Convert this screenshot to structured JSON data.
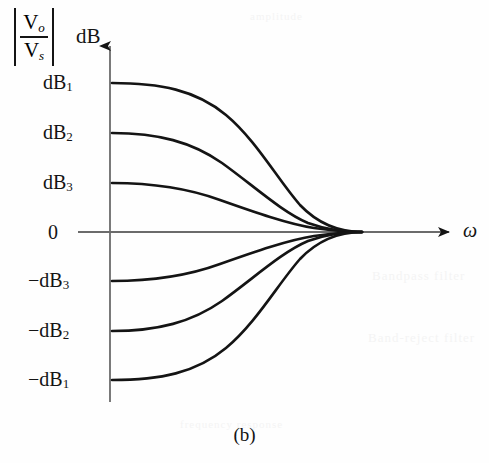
{
  "figure": {
    "caption": "(b)",
    "axis": {
      "y_label_numerator": "V",
      "y_label_numerator_sub": "o",
      "y_label_denominator": "V",
      "y_label_denominator_sub": "s",
      "y_label_unit": "dB",
      "x_label": "ω"
    },
    "y_ticks": [
      {
        "label": "dB",
        "sub": "1",
        "sign": "",
        "value": 83
      },
      {
        "label": "dB",
        "sub": "2",
        "sign": "",
        "value": 133
      },
      {
        "label": "dB",
        "sub": "3",
        "sign": "",
        "value": 183
      },
      {
        "label": "0",
        "sub": "",
        "sign": "",
        "value": 232
      },
      {
        "label": "dB",
        "sub": "3",
        "sign": "−",
        "value": 281
      },
      {
        "label": "dB",
        "sub": "2",
        "sign": "−",
        "value": 331
      },
      {
        "label": "dB",
        "sub": "1",
        "sign": "−",
        "value": 380
      }
    ],
    "bleed_text": {
      "line1": "Bandpass  filter",
      "line2": "Band-reject  filter",
      "line3": "amplitude",
      "line4": "frequency  response"
    },
    "colors": {
      "ink": "#141414",
      "axis": "#6b6b6b",
      "paper": "#fefefe"
    }
  },
  "chart_data": {
    "type": "line",
    "title": "",
    "subtitle": "(b)",
    "xlabel": "ω",
    "ylabel": "|Vo/Vs| dB",
    "grid": false,
    "legend": "none",
    "xlim": [
      110,
      455
    ],
    "ylim": [
      -3,
      3
    ],
    "axis_origin_px": {
      "x": 110,
      "y": 232
    },
    "convergence_point_px": {
      "x": 362,
      "y": 232
    },
    "ytick_labels": [
      "dB₁",
      "dB₂",
      "dB₃",
      "0",
      "−dB₃",
      "−dB₂",
      "−dB₁"
    ],
    "ytick_values": [
      3,
      2,
      1,
      0,
      -1,
      -2,
      -3
    ],
    "series": [
      {
        "name": "dB1 boost",
        "start_level": "dB₁",
        "path": "M 112,83 C 160,83 196,90 226,115 C 256,140 278,180 300,205 C 322,228 345,232 362,232"
      },
      {
        "name": "dB2 boost",
        "start_level": "dB₂",
        "path": "M 112,133 C 158,133 192,142 222,163 C 254,186 282,212 308,223 C 330,231 348,232 362,232"
      },
      {
        "name": "dB3 boost",
        "start_level": "dB₃",
        "path": "M 112,183 C 156,183 190,189 220,200 C 254,212 288,224 314,228 C 336,231 350,232 362,232"
      },
      {
        "name": "dB3 cut",
        "start_level": "−dB₃",
        "path": "M 112,281 C 156,281 190,275 220,264 C 254,252 288,240 314,236 C 336,233 350,232 362,232"
      },
      {
        "name": "dB2 cut",
        "start_level": "−dB₂",
        "path": "M 112,331 C 158,331 192,322 222,301 C 254,278 282,252 308,241 C 330,233 348,232 362,232"
      },
      {
        "name": "dB1 cut",
        "start_level": "−dB₁",
        "path": "M 112,380 C 160,380 196,373 226,348 C 256,323 278,284 300,259 C 322,236 345,232 362,232"
      }
    ]
  }
}
